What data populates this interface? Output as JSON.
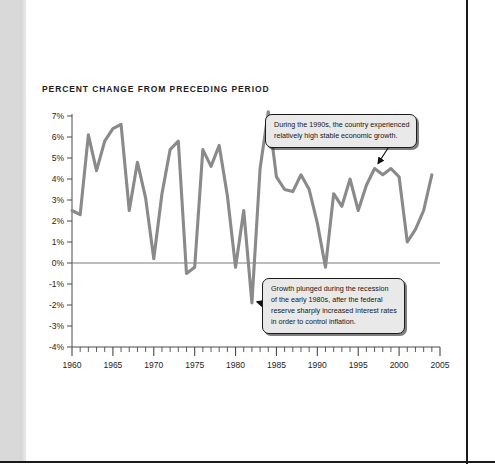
{
  "figure": {
    "title": "PERCENT CHANGE FROM PRECEDING PERIOD",
    "line_color": "#8a8a8a",
    "axis_color": "#4a4a4a",
    "text_color": "#1d1d1d"
  },
  "annotations": {
    "nineties": {
      "name": "callout-1990s",
      "line1": "During the 1990s, the country experienced",
      "line2": "relatively high stable economic growth."
    },
    "recession": {
      "name": "callout-recession",
      "line1": "Growth plunged during the recession",
      "line2": "of the early 1980s, after the federal",
      "line3": "reserve sharply increased interest rates",
      "line4": "in order to control inflation."
    }
  },
  "chart_data": {
    "type": "line",
    "title": "PERCENT CHANGE FROM PRECEDING PERIOD",
    "xlabel": "",
    "ylabel": "",
    "xlim": [
      1960,
      2005
    ],
    "ylim": [
      -4,
      7
    ],
    "grid": false,
    "legend": "none",
    "zero_line": true,
    "x_tick_labels": [
      "1960",
      "1965",
      "1970",
      "1975",
      "1980",
      "1985",
      "1990",
      "1995",
      "2000",
      "2005"
    ],
    "x_tick_values": [
      1960,
      1965,
      1970,
      1975,
      1980,
      1985,
      1990,
      1995,
      2000,
      2005
    ],
    "x_minor_tick_step": 1,
    "y_tick_labels": [
      "7%",
      "6%",
      "5%",
      "4%",
      "3%",
      "2%",
      "1%",
      "0%",
      "-1%",
      "-2%",
      "-3%",
      "-4%"
    ],
    "y_tick_values": [
      7,
      6,
      5,
      4,
      3,
      2,
      1,
      0,
      -1,
      -2,
      -3,
      -4
    ],
    "x": [
      1960,
      1961,
      1962,
      1963,
      1964,
      1965,
      1966,
      1967,
      1968,
      1969,
      1970,
      1971,
      1972,
      1973,
      1974,
      1975,
      1976,
      1977,
      1978,
      1979,
      1980,
      1981,
      1982,
      1983,
      1984,
      1985,
      1986,
      1987,
      1988,
      1989,
      1990,
      1991,
      1992,
      1993,
      1994,
      1995,
      1996,
      1997,
      1998,
      1999,
      2000,
      2001,
      2002,
      2003,
      2004
    ],
    "values": [
      2.5,
      2.3,
      6.1,
      4.4,
      5.8,
      6.4,
      6.6,
      2.5,
      4.8,
      3.1,
      0.2,
      3.3,
      5.4,
      5.8,
      -0.5,
      -0.2,
      5.4,
      4.6,
      5.6,
      3.2,
      -0.2,
      2.5,
      -1.9,
      4.5,
      7.2,
      4.1,
      3.5,
      3.4,
      4.2,
      3.5,
      1.9,
      -0.2,
      3.3,
      2.7,
      4.0,
      2.5,
      3.7,
      4.5,
      4.2,
      4.5,
      4.1,
      1.0,
      1.6,
      2.5,
      4.2
    ],
    "series": [
      {
        "name": "Percent change from preceding period",
        "values": [
          2.5,
          2.3,
          6.1,
          4.4,
          5.8,
          6.4,
          6.6,
          2.5,
          4.8,
          3.1,
          0.2,
          3.3,
          5.4,
          5.8,
          -0.5,
          -0.2,
          5.4,
          4.6,
          5.6,
          3.2,
          -0.2,
          2.5,
          -1.9,
          4.5,
          7.2,
          4.1,
          3.5,
          3.4,
          4.2,
          3.5,
          1.9,
          -0.2,
          3.3,
          2.7,
          4.0,
          2.5,
          3.7,
          4.5,
          4.2,
          4.5,
          4.1,
          1.0,
          1.6,
          2.5,
          4.2
        ]
      }
    ],
    "annotations": [
      {
        "text": "During the 1990s, the country experienced relatively high stable economic growth.",
        "points_to_year": 1997,
        "points_to_value": 4.5
      },
      {
        "text": "Growth plunged during the recession of the early 1980s, after the federal reserve sharply increased interest rates in order to control inflation.",
        "points_to_year": 1982,
        "points_to_value": -1.9
      }
    ]
  }
}
